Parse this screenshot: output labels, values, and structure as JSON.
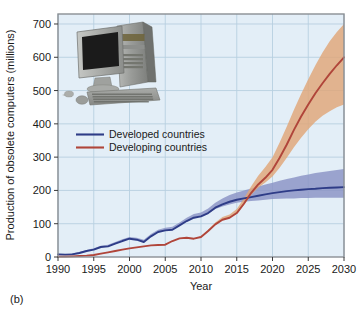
{
  "panel": {
    "label": "(b)"
  },
  "chart_data": {
    "type": "line",
    "title": "",
    "xlabel": "Year",
    "ylabel": "Production of obsolete computers (millions)",
    "xlim": [
      1990,
      2030
    ],
    "ylim": [
      0,
      730
    ],
    "xticks": [
      1990,
      1995,
      2000,
      2005,
      2010,
      2015,
      2020,
      2025,
      2030
    ],
    "xticklabels": [
      "1990",
      "1995",
      "2000",
      "2005",
      "2010",
      "2015",
      "2020",
      "2025",
      "2030"
    ],
    "yticks": [
      0,
      100,
      200,
      300,
      400,
      500,
      600,
      700
    ],
    "yticklabels": [
      "0",
      "100",
      "200",
      "300",
      "400",
      "500",
      "600",
      "700"
    ],
    "grid": true,
    "legend_position": "upper-left-inside",
    "plot_background": "#e3eef7",
    "x": [
      1990,
      1991,
      1992,
      1993,
      1994,
      1995,
      1996,
      1997,
      1998,
      1999,
      2000,
      2001,
      2002,
      2003,
      2004,
      2005,
      2006,
      2007,
      2008,
      2009,
      2010,
      2011,
      2012,
      2013,
      2014,
      2015,
      2016,
      2017,
      2018,
      2019,
      2020,
      2021,
      2022,
      2023,
      2024,
      2025,
      2026,
      2027,
      2028,
      2029,
      2030
    ],
    "series": [
      {
        "name": "Developed countries",
        "color": "#2e3c87",
        "band_color": "#8a93c4",
        "values": [
          8,
          7,
          8,
          12,
          18,
          22,
          30,
          32,
          40,
          48,
          55,
          52,
          45,
          62,
          75,
          80,
          82,
          95,
          108,
          118,
          122,
          132,
          148,
          158,
          166,
          172,
          176,
          180,
          184,
          188,
          192,
          195,
          198,
          200,
          202,
          204,
          205,
          207,
          208,
          209,
          210
        ],
        "band_lower": [
          8,
          7,
          8,
          12,
          18,
          22,
          30,
          32,
          40,
          48,
          55,
          52,
          45,
          62,
          75,
          80,
          82,
          95,
          108,
          118,
          122,
          130,
          144,
          152,
          158,
          163,
          166,
          168,
          170,
          172,
          174,
          175,
          176,
          176,
          177,
          177,
          178,
          178,
          178,
          178,
          178
        ],
        "band_upper": [
          10,
          9,
          11,
          15,
          21,
          26,
          34,
          37,
          45,
          53,
          60,
          58,
          52,
          69,
          82,
          88,
          91,
          104,
          118,
          129,
          134,
          146,
          163,
          176,
          186,
          194,
          200,
          206,
          212,
          218,
          223,
          229,
          234,
          239,
          244,
          248,
          252,
          255,
          258,
          261,
          264
        ]
      },
      {
        "name": "Developing countries",
        "color": "#b0453a",
        "band_color": "#e0a678",
        "values": [
          1,
          1,
          2,
          3,
          4,
          6,
          10,
          14,
          18,
          22,
          26,
          29,
          32,
          35,
          36,
          37,
          48,
          56,
          58,
          55,
          60,
          78,
          98,
          112,
          118,
          132,
          160,
          192,
          218,
          238,
          262,
          298,
          338,
          382,
          422,
          458,
          492,
          522,
          550,
          576,
          600
        ],
        "band_lower": [
          1,
          1,
          2,
          3,
          4,
          6,
          10,
          14,
          18,
          22,
          26,
          29,
          32,
          35,
          36,
          37,
          48,
          56,
          58,
          55,
          60,
          78,
          98,
          112,
          118,
          130,
          156,
          186,
          208,
          224,
          242,
          268,
          298,
          330,
          358,
          384,
          406,
          424,
          438,
          450,
          458
        ],
        "band_upper": [
          1,
          1,
          2,
          3,
          4,
          6,
          10,
          14,
          18,
          22,
          26,
          29,
          32,
          35,
          36,
          37,
          48,
          56,
          58,
          55,
          62,
          82,
          104,
          120,
          128,
          144,
          176,
          212,
          244,
          270,
          300,
          344,
          392,
          442,
          490,
          534,
          576,
          614,
          648,
          676,
          700
        ]
      }
    ],
    "annotations": [
      {
        "type": "image",
        "name": "desktop-computer-photo",
        "description": "Photograph of a desktop computer with CRT monitor, tower, keyboard and mouse"
      }
    ]
  }
}
